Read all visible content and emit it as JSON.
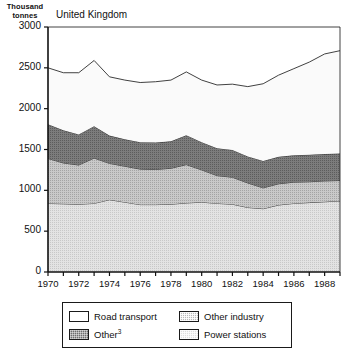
{
  "chart_data": {
    "type": "area",
    "title": "United Kingdom",
    "stacked": true,
    "xlabel": "",
    "ylabel": "Thousand tonnes",
    "ylabel_line1": "Thousand",
    "ylabel_line2": "tonnes",
    "ylim": [
      0,
      3000
    ],
    "yticks": [
      0,
      500,
      1000,
      1500,
      2000,
      2500,
      3000
    ],
    "ytick_labels": [
      "0",
      "500",
      "1000",
      "1500",
      "2000",
      "2500",
      "3000"
    ],
    "grid": false,
    "legend_position": "below-plot",
    "xlim": [
      1970,
      1989
    ],
    "x": [
      1970,
      1971,
      1972,
      1973,
      1974,
      1975,
      1976,
      1977,
      1978,
      1979,
      1980,
      1981,
      1982,
      1983,
      1984,
      1985,
      1986,
      1987,
      1988,
      1989
    ],
    "xticks": [
      1970,
      1971,
      1972,
      1973,
      1974,
      1975,
      1976,
      1977,
      1978,
      1979,
      1980,
      1981,
      1982,
      1983,
      1984,
      1985,
      1986,
      1987,
      1988,
      1989
    ],
    "xtick_labels": [
      "1970",
      "",
      "1972",
      "",
      "1974",
      "",
      "1976",
      "",
      "1978",
      "",
      "1980",
      "",
      "1982",
      "",
      "1984",
      "",
      "1986",
      "",
      "1988",
      ""
    ],
    "series": [
      {
        "name": "Power stations",
        "order": 1,
        "fill": "light-stipple",
        "color": "#dedede",
        "values": [
          840,
          835,
          830,
          840,
          885,
          855,
          825,
          825,
          830,
          845,
          855,
          840,
          830,
          790,
          775,
          820,
          840,
          850,
          860,
          870
        ]
      },
      {
        "name": "Other industry",
        "order": 2,
        "fill": "medium-stipple",
        "color": "#b9b9b9",
        "values": [
          550,
          500,
          480,
          555,
          445,
          440,
          435,
          430,
          440,
          470,
          395,
          340,
          330,
          300,
          255,
          260,
          260,
          255,
          255,
          250
        ]
      },
      {
        "name": "Other",
        "order": 3,
        "fill": "dark-stipple",
        "color": "#6e6e6e",
        "footnote": "3",
        "values": [
          420,
          400,
          375,
          390,
          340,
          330,
          330,
          330,
          330,
          360,
          340,
          335,
          335,
          325,
          330,
          330,
          330,
          330,
          330,
          330
        ]
      },
      {
        "name": "Road transport",
        "order": 4,
        "fill": "white",
        "color": "#ffffff",
        "values": [
          690,
          705,
          755,
          805,
          720,
          725,
          730,
          745,
          750,
          775,
          760,
          775,
          805,
          855,
          945,
          1000,
          1060,
          1135,
          1225,
          1260
        ]
      }
    ],
    "totals": [
      2500,
      2440,
      2440,
      2590,
      2390,
      2350,
      2320,
      2330,
      2350,
      2450,
      2350,
      2290,
      2300,
      2270,
      2305,
      2410,
      2490,
      2570,
      2670,
      2710
    ]
  },
  "legend": {
    "entries": [
      {
        "label": "Road transport",
        "swatch": "road-transport-swatch",
        "sup": ""
      },
      {
        "label": "Other industry",
        "swatch": "other-industry-swatch",
        "sup": ""
      },
      {
        "label": "Other",
        "swatch": "other-swatch",
        "sup": "3"
      },
      {
        "label": "Power stations",
        "swatch": "power-stations-swatch",
        "sup": ""
      }
    ]
  }
}
